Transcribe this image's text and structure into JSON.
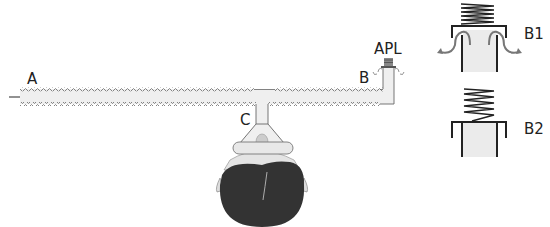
{
  "labels": {
    "a": "A",
    "b": "B",
    "c": "C",
    "apl": "APL",
    "b1": "B1",
    "b2": "B2"
  },
  "components": [
    {
      "id": "A",
      "description": "fresh gas inlet with flow arrow"
    },
    {
      "id": "B",
      "description": "corrugated breathing tube leading to APL valve"
    },
    {
      "id": "C",
      "description": "T-piece connector to face mask"
    },
    {
      "id": "APL",
      "description": "adjustable pressure limiting valve"
    },
    {
      "id": "B1",
      "description": "APL valve open, gas venting"
    },
    {
      "id": "B2",
      "description": "APL valve closed"
    }
  ],
  "colors": {
    "line": "#555555",
    "tube_fill": "#efefef",
    "arrow": "#777777",
    "head": "#333333",
    "spring": "#222222"
  }
}
